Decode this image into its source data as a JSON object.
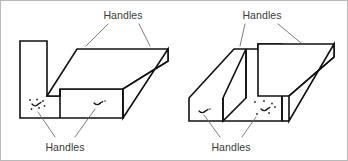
{
  "figure": {
    "background_color": "#ffffff",
    "line_color": "#111111",
    "leader_color": "#6d6d6d",
    "text_color": "#3a3a3a",
    "labels": {
      "left_top": "Handles",
      "left_bottom": "Handles",
      "right_top": "Handles",
      "right_bottom": "Handles"
    },
    "diagrams": [
      {
        "name": "left-block",
        "description": "L-shaped block with tall vertical leg on the left and long horizontal slab extending to the right",
        "handle_count": 2,
        "top_label": "Handles",
        "bottom_label": "Handles"
      },
      {
        "name": "right-block",
        "description": "Block with raised vertical rib at center and long horizontal slab extending to the right",
        "handle_count": 2,
        "top_label": "Handles",
        "bottom_label": "Handles"
      }
    ]
  }
}
